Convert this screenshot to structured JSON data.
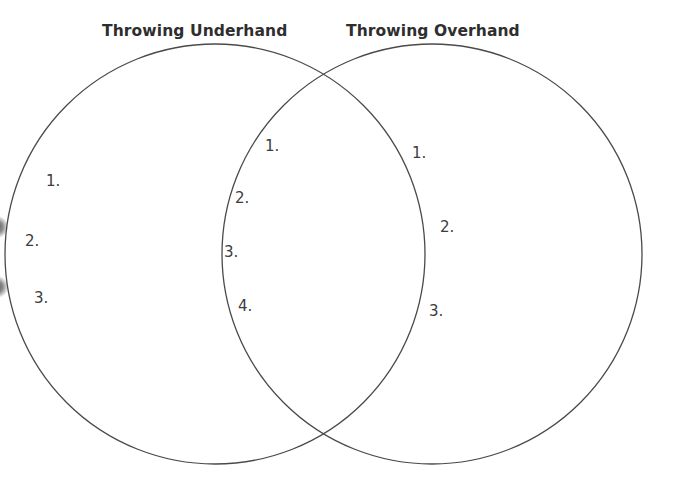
{
  "diagram": {
    "type": "venn",
    "colors": {
      "line": "#4a4a4a",
      "text": "#3a3a3a",
      "background": "#ffffff"
    },
    "circles": [
      {
        "id": "left",
        "title": "Throwing Underhand",
        "cx": 215,
        "cy": 254,
        "r": 210,
        "items": [
          "1.",
          "2.",
          "3."
        ]
      },
      {
        "id": "right",
        "title": "Throwing Overhand",
        "cx": 432,
        "cy": 254,
        "r": 210,
        "items": [
          "1.",
          "2.",
          "3."
        ]
      }
    ],
    "overlap": {
      "items": [
        "1.",
        "2.",
        "3.",
        "4."
      ]
    }
  }
}
